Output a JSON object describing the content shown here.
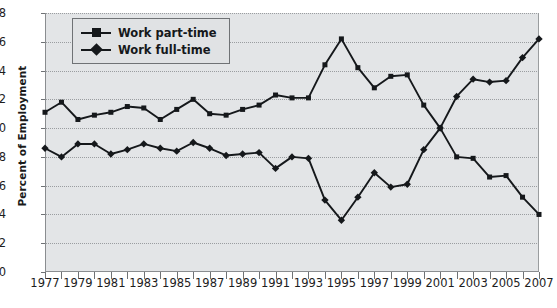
{
  "chart_data": {
    "type": "line",
    "title": "",
    "xlabel": "",
    "ylabel": "Percent of Employment",
    "ylim": [
      40,
      58
    ],
    "ytick_step": 2,
    "yticks": [
      40,
      42,
      44,
      46,
      48,
      50,
      52,
      54,
      56,
      58
    ],
    "xlim": [
      1977,
      2007
    ],
    "x": [
      1977,
      1978,
      1979,
      1980,
      1981,
      1982,
      1983,
      1984,
      1985,
      1986,
      1987,
      1988,
      1989,
      1990,
      1991,
      1992,
      1993,
      1994,
      1995,
      1996,
      1997,
      1998,
      1999,
      2000,
      2001,
      2002,
      2003,
      2004,
      2005,
      2006,
      2007
    ],
    "xticks": [
      1977,
      1978,
      1979,
      1980,
      1981,
      1982,
      1983,
      1984,
      1985,
      1986,
      1987,
      1988,
      1989,
      1990,
      1991,
      1992,
      1993,
      1994,
      1995,
      1996,
      1997,
      1998,
      1999,
      2000,
      2001,
      2002,
      2003,
      2004,
      2005,
      2006,
      2007
    ],
    "xtick_labels": [
      "1977",
      "",
      "1979",
      "",
      "1981",
      "",
      "1983",
      "",
      "1985",
      "",
      "1987",
      "",
      "1989",
      "",
      "1991",
      "",
      "1993",
      "",
      "1995",
      "",
      "1997",
      "",
      "1999",
      "",
      "2001",
      "",
      "2003",
      "",
      "2005",
      "",
      "2007"
    ],
    "grid": true,
    "grid_style": "dotted",
    "legend_position": "top-left",
    "plot_background": "#e3e5e7",
    "series": [
      {
        "name": "Work part-time",
        "marker": "square",
        "color": "#15181b",
        "values": [
          51.1,
          51.8,
          50.6,
          50.9,
          51.1,
          51.5,
          51.4,
          50.6,
          51.3,
          52.0,
          51.0,
          50.9,
          51.3,
          51.6,
          52.3,
          52.1,
          52.1,
          54.4,
          56.2,
          54.2,
          52.8,
          53.6,
          53.7,
          51.6,
          50.0,
          48.0,
          47.9,
          46.6,
          46.7,
          45.2,
          44.0
        ]
      },
      {
        "name": "Work full-time",
        "marker": "diamond",
        "color": "#15181b",
        "values": [
          48.6,
          48.0,
          48.9,
          48.9,
          48.2,
          48.5,
          48.9,
          48.6,
          48.4,
          49.0,
          48.6,
          48.1,
          48.2,
          48.3,
          47.2,
          48.0,
          47.9,
          45.0,
          43.6,
          45.2,
          46.9,
          45.9,
          46.1,
          48.5,
          50.0,
          52.2,
          53.4,
          53.2,
          53.3,
          54.9,
          56.2
        ]
      }
    ]
  },
  "legend": {
    "entries": [
      {
        "label": "Work part-time",
        "marker": "square"
      },
      {
        "label": "Work full-time",
        "marker": "diamond"
      }
    ]
  }
}
